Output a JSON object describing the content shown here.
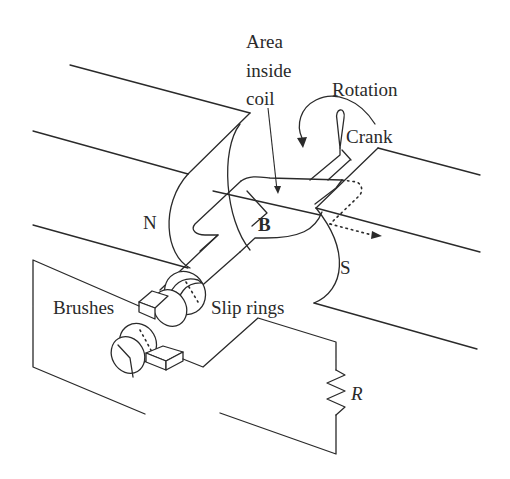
{
  "labels": {
    "area_inside_coil_line1": "Area",
    "area_inside_coil_line2": "inside",
    "area_inside_coil_line3": "coil",
    "rotation": "Rotation",
    "crank": "Crank",
    "north_pole": "N",
    "south_pole": "S",
    "magnetic_field": "B",
    "brushes": "Brushes",
    "slip_rings": "Slip rings",
    "resistor": "R"
  },
  "colors": {
    "line": "#2a2a2a",
    "background": "#ffffff"
  }
}
